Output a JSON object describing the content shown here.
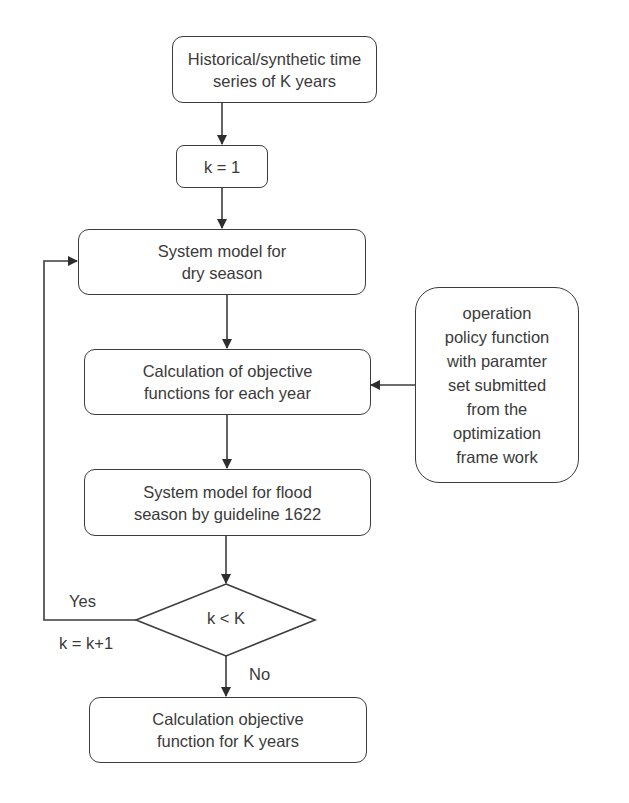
{
  "diagram": {
    "type": "flowchart",
    "colors": {
      "stroke": "#3c3c3c",
      "text": "#3a3a3a",
      "background": "#ffffff"
    },
    "nodes": {
      "input": {
        "text": "Historical/synthetic time\nseries of K years"
      },
      "init": {
        "text": "k = 1"
      },
      "dry_season": {
        "text": "System model for\ndry season"
      },
      "objective_each_year": {
        "text": "Calculation of objective\nfunctions for each year"
      },
      "policy": {
        "text": "operation\npolicy function\nwith  paramter\nset submitted\nfrom the\noptimization\nframe work"
      },
      "flood_season": {
        "text": "System model for flood\nseason by guideline  1622"
      },
      "decision": {
        "text": "k < K"
      },
      "objective_k_years": {
        "text": "Calculation objective\nfunction for K years"
      }
    },
    "edge_labels": {
      "yes": "Yes",
      "increment": "k = k+1",
      "no": "No"
    }
  }
}
